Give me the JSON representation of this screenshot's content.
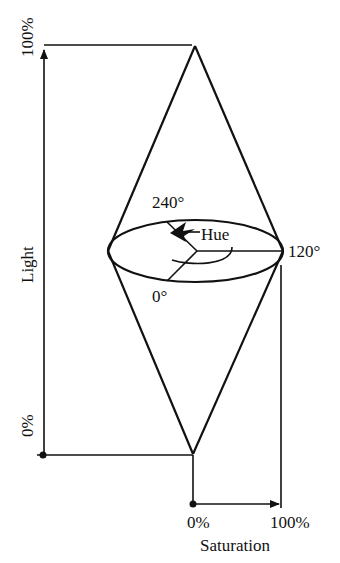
{
  "figure": {
    "type": "HLS double-cone color model",
    "stroke_color": "#111111",
    "background": "#ffffff"
  },
  "light_axis": {
    "label": "Light",
    "top_label": "100%",
    "bottom_label": "0%"
  },
  "saturation_axis": {
    "label": "Saturation",
    "left_label": "0%",
    "right_label": "100%"
  },
  "hue": {
    "label": "Hue",
    "angles": {
      "back": "240°",
      "right": "120°",
      "front": "0°"
    }
  }
}
